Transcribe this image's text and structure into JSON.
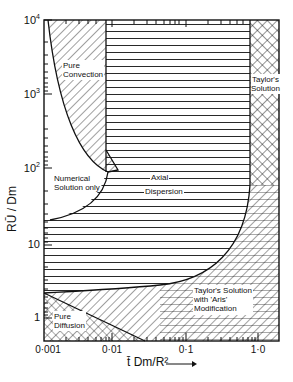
{
  "figure": {
    "y_axis": {
      "label": "RŪ / Dm",
      "ticks": [
        {
          "base": "10",
          "exp": "4"
        },
        {
          "base": "10",
          "exp": "3"
        },
        {
          "base": "10",
          "exp": "2"
        },
        {
          "base": "10",
          "exp": ""
        },
        {
          "base": "1",
          "exp": ""
        }
      ]
    },
    "x_axis": {
      "label": "t̄ Dm/R²",
      "arrow": "⟶",
      "ticks": [
        "0·001",
        "0·01",
        "0·1",
        "1·0"
      ]
    },
    "regions": {
      "pure_convection": [
        "Pure",
        "Convection"
      ],
      "numerical": [
        "Numerical",
        "Solution  only"
      ],
      "axial_dispersion": [
        "Axial",
        "Dispersion"
      ],
      "taylor": [
        "Taylor's",
        "Solution"
      ],
      "taylor_aris": [
        "Taylor's Solution",
        "with 'Aris'",
        "Modification"
      ],
      "pure_diffusion": [
        "Pure",
        "Diffusion"
      ]
    },
    "colors": {
      "ink": "#111111",
      "paper": "#ffffff"
    }
  }
}
